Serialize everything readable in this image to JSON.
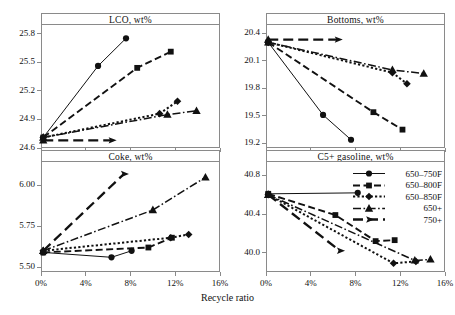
{
  "figure": {
    "xlabel": "Recycle ratio",
    "series_names": [
      "650–750F",
      "650–800F",
      "650–850F",
      "650+",
      "750+"
    ]
  },
  "legend": {
    "items": [
      {
        "label": "650–750F",
        "marker": "circle",
        "dash": "solid"
      },
      {
        "label": "650–800F",
        "marker": "square",
        "dash": "dashed"
      },
      {
        "label": "650–850F",
        "marker": "diamond",
        "dash": "dotted"
      },
      {
        "label": "650+",
        "marker": "triangle",
        "dash": "dashdot"
      },
      {
        "label": "750+",
        "marker": "arrow",
        "dash": "longdash"
      }
    ]
  },
  "chart_data": [
    {
      "type": "line",
      "title": "LCO, wt%",
      "xlabel": "Recycle ratio",
      "ylabel": "LCO, wt%",
      "xlim": [
        0,
        16
      ],
      "ylim": [
        24.6,
        25.9
      ],
      "xticks": [
        "0%",
        "4%",
        "8%",
        "12%",
        "16%"
      ],
      "xtickvals": [
        0,
        4,
        8,
        12,
        16
      ],
      "yticks": [
        "24.6",
        "24.9",
        "25.2",
        "25.5",
        "25.8"
      ],
      "ytickvals": [
        24.6,
        24.9,
        25.2,
        25.5,
        25.8
      ],
      "grid": false,
      "series": [
        {
          "name": "650–750F",
          "x": [
            0.2,
            5.1,
            7.6
          ],
          "values": [
            24.71,
            25.46,
            25.75
          ]
        },
        {
          "name": "650–800F",
          "x": [
            0.2,
            8.6,
            11.6
          ],
          "values": [
            24.71,
            25.44,
            25.61
          ]
        },
        {
          "name": "650–850F",
          "x": [
            0.2,
            10.6,
            12.2
          ],
          "values": [
            24.71,
            24.96,
            25.09
          ]
        },
        {
          "name": "650+",
          "x": [
            0.2,
            11.3,
            13.9
          ],
          "values": [
            24.71,
            24.95,
            24.99
          ]
        },
        {
          "name": "750+",
          "x": [
            0.2,
            6.3
          ],
          "values": [
            24.68,
            24.68
          ]
        }
      ]
    },
    {
      "type": "line",
      "title": "Bottoms, wt%",
      "xlabel": "Recycle ratio",
      "ylabel": "Bottoms, wt%",
      "xlim": [
        0,
        16
      ],
      "ylim": [
        19.15,
        20.5
      ],
      "xticks": [
        "0%",
        "4%",
        "8%",
        "12%",
        "16%"
      ],
      "xtickvals": [
        0,
        4,
        8,
        12,
        16
      ],
      "yticks": [
        "19.2",
        "19.5",
        "19.8",
        "20.1",
        "20.4"
      ],
      "ytickvals": [
        19.2,
        19.5,
        19.8,
        20.1,
        20.4
      ],
      "grid": false,
      "series": [
        {
          "name": "650–750F",
          "x": [
            0.2,
            5.1,
            7.6
          ],
          "values": [
            20.3,
            19.51,
            19.24
          ]
        },
        {
          "name": "650–800F",
          "x": [
            0.2,
            9.6,
            12.2
          ],
          "values": [
            20.3,
            19.54,
            19.35
          ]
        },
        {
          "name": "650–850F",
          "x": [
            0.2,
            11.3,
            12.6
          ],
          "values": [
            20.3,
            19.97,
            19.85
          ]
        },
        {
          "name": "650+",
          "x": [
            0.2,
            11.3,
            14.1
          ],
          "values": [
            20.3,
            20.0,
            19.96
          ]
        },
        {
          "name": "750+",
          "x": [
            0.2,
            6.4
          ],
          "values": [
            20.33,
            20.33
          ]
        }
      ]
    },
    {
      "type": "line",
      "title": "Coke, wt%",
      "xlabel": "Recycle ratio",
      "ylabel": "Coke, wt%",
      "xlim": [
        0,
        16
      ],
      "ylim": [
        5.47,
        6.15
      ],
      "xticks": [
        "0%",
        "4%",
        "8%",
        "12%",
        "16%"
      ],
      "xtickvals": [
        0,
        4,
        8,
        12,
        16
      ],
      "yticks": [
        "5.50",
        "5.75",
        "6.00"
      ],
      "ytickvals": [
        5.5,
        5.75,
        6.0
      ],
      "grid": false,
      "series": [
        {
          "name": "650–750F",
          "x": [
            0.2,
            6.3,
            8.1
          ],
          "values": [
            5.59,
            5.56,
            5.6
          ]
        },
        {
          "name": "650–800F",
          "x": [
            0.2,
            9.6,
            11.7
          ],
          "values": [
            5.59,
            5.62,
            5.68
          ]
        },
        {
          "name": "650–850F",
          "x": [
            0.2,
            11.6,
            13.2
          ],
          "values": [
            5.6,
            5.68,
            5.7
          ]
        },
        {
          "name": "650+",
          "x": [
            0.2,
            10.0,
            14.7
          ],
          "values": [
            5.6,
            5.85,
            6.05
          ]
        },
        {
          "name": "750+",
          "x": [
            0.2,
            7.4
          ],
          "values": [
            5.6,
            6.07
          ]
        }
      ]
    },
    {
      "type": "line",
      "title": "C5+ gasoline, wt%",
      "xlabel": "Recycle ratio",
      "ylabel": "C5+ gasoline, wt%",
      "xlim": [
        0,
        16
      ],
      "ylim": [
        39.8,
        40.95
      ],
      "xticks": [
        "0%",
        "4%",
        "8%",
        "12%",
        "16%"
      ],
      "xtickvals": [
        0,
        4,
        8,
        12,
        16
      ],
      "yticks": [
        "40.0",
        "40.4",
        "40.8"
      ],
      "ytickvals": [
        40.0,
        40.4,
        40.8
      ],
      "grid": false,
      "series": [
        {
          "name": "650–750F",
          "x": [
            0.2,
            8.2
          ],
          "values": [
            40.61,
            40.62
          ]
        },
        {
          "name": "650–800F",
          "x": [
            0.2,
            6.2,
            9.8,
            11.5
          ],
          "values": [
            40.61,
            40.39,
            40.12,
            40.13
          ]
        },
        {
          "name": "650–850F",
          "x": [
            0.2,
            11.4,
            13.4
          ],
          "values": [
            40.6,
            39.89,
            39.91
          ]
        },
        {
          "name": "650+",
          "x": [
            0.2,
            13.3,
            14.7
          ],
          "values": [
            40.6,
            39.92,
            39.93
          ]
        },
        {
          "name": "750+",
          "x": [
            0.2,
            6.6
          ],
          "values": [
            40.6,
            40.02
          ]
        }
      ]
    }
  ]
}
